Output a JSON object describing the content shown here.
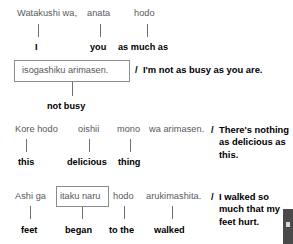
{
  "document": {
    "title": "Japanese comparison sentence breakdowns",
    "colors": {
      "romaji_text": "#58585a",
      "gloss_text": "#000000",
      "connector_line": "#6d6e70",
      "box_border": "#8a8c8e",
      "background": "#ffffff"
    },
    "separator": "/"
  },
  "examples": [
    {
      "id": "example-1",
      "japanese_segments": [
        {
          "text": "Watakushi wa,",
          "x": 17,
          "y": 8
        },
        {
          "text": "anata",
          "x": 87,
          "y": 8
        },
        {
          "text": "hodo",
          "x": 134,
          "y": 8
        }
      ],
      "connectors": [
        {
          "x": 38,
          "y": 24,
          "height": 13
        },
        {
          "x": 100,
          "y": 24,
          "height": 13
        },
        {
          "x": 147,
          "y": 24,
          "height": 13
        }
      ],
      "glosses": [
        {
          "text": "I",
          "x": 35,
          "y": 42
        },
        {
          "text": "you",
          "x": 90,
          "y": 42
        },
        {
          "text": "as much as",
          "x": 118,
          "y": 42
        }
      ],
      "boxed_phrase": {
        "text": "isogashiku arimasen.",
        "box_x": 14,
        "box_y": 60,
        "box_width": 116,
        "box_height": 22,
        "text_x": 22,
        "text_y": 65
      },
      "box_connector": {
        "x": 72,
        "y": 82,
        "height": 14
      },
      "box_gloss": {
        "text": "not busy",
        "x": 47,
        "y": 101
      },
      "translation": {
        "slash": "/",
        "text": "I'm not as busy as you are.",
        "slash_x": 135,
        "text_x": 143,
        "y": 64,
        "width": 150
      }
    },
    {
      "id": "example-2",
      "japanese_segments": [
        {
          "text": "Kore hodo",
          "x": 15,
          "y": 124
        },
        {
          "text": "oishii",
          "x": 78,
          "y": 124
        },
        {
          "text": "mono",
          "x": 117,
          "y": 124
        },
        {
          "text": "wa arimasen.",
          "x": 149,
          "y": 124
        }
      ],
      "connectors": [
        {
          "x": 26,
          "y": 139,
          "height": 13
        },
        {
          "x": 89,
          "y": 139,
          "height": 13
        },
        {
          "x": 130,
          "y": 139,
          "height": 13
        }
      ],
      "glosses": [
        {
          "text": "this",
          "x": 18,
          "y": 157
        },
        {
          "text": "delicious",
          "x": 67,
          "y": 157
        },
        {
          "text": "thing",
          "x": 118,
          "y": 157
        }
      ],
      "translation": {
        "slash": "/",
        "text": "There's nothing as delicious as this.",
        "slash_x": 211,
        "text_x": 219,
        "y": 124,
        "width": 70
      }
    },
    {
      "id": "example-3",
      "japanese_segments": [
        {
          "text": "Ashi ga",
          "x": 15,
          "y": 191
        },
        {
          "text": "hodo",
          "x": 113,
          "y": 191
        },
        {
          "text": "arukimashita.",
          "x": 146,
          "y": 191
        }
      ],
      "boxed_phrase": {
        "text": "itaku naru",
        "box_x": 56,
        "box_y": 186,
        "box_width": 53,
        "box_height": 21,
        "text_x": 60,
        "text_y": 191
      },
      "connectors": [
        {
          "x": 30,
          "y": 206,
          "height": 13
        },
        {
          "x": 82,
          "y": 207,
          "height": 12
        },
        {
          "x": 124,
          "y": 206,
          "height": 13
        },
        {
          "x": 172,
          "y": 206,
          "height": 13
        }
      ],
      "glosses": [
        {
          "text": "feet",
          "x": 21,
          "y": 225
        },
        {
          "text": "began",
          "x": 65,
          "y": 225
        },
        {
          "text": "to the",
          "x": 109,
          "y": 225
        },
        {
          "text": "walked",
          "x": 154,
          "y": 225
        }
      ],
      "translation": {
        "slash": "/",
        "text": "I walked so much that my feet hurt.",
        "slash_x": 211,
        "text_x": 219,
        "y": 191,
        "width": 70
      }
    }
  ]
}
